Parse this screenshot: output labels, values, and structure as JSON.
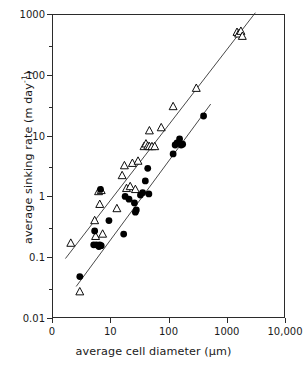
{
  "chart_data": {
    "type": "scatter",
    "title": "",
    "xlabel": "average cell diameter (µm)",
    "ylabel": "average sinking rate (m day⁻¹)",
    "xscale": "log",
    "yscale": "log",
    "xlim": [
      1,
      10000
    ],
    "ylim": [
      0.01,
      1000
    ],
    "grid": false,
    "legend": "none",
    "xticks": [
      1,
      10,
      100,
      1000,
      10000
    ],
    "xticklabels": [
      "0",
      "10",
      "100",
      "1000",
      "10,000"
    ],
    "yticks": [
      0.01,
      0.1,
      1,
      10,
      100,
      1000
    ],
    "yticklabels": [
      "0.01",
      "0.1",
      "1",
      "10",
      "100",
      "1000"
    ],
    "series": [
      {
        "name": "open triangles",
        "marker": "triangle-up-open",
        "color": "#000000",
        "points": [
          [
            2.1,
            0.17
          ],
          [
            3.0,
            0.027
          ],
          [
            5.4,
            0.4
          ],
          [
            5.6,
            0.22
          ],
          [
            6.3,
            1.2
          ],
          [
            6.6,
            0.74
          ],
          [
            7.0,
            1.25
          ],
          [
            7.4,
            0.24
          ],
          [
            13.0,
            0.63
          ],
          [
            16.0,
            2.2
          ],
          [
            17.5,
            3.2
          ],
          [
            19.0,
            1.35
          ],
          [
            22.0,
            1.45
          ],
          [
            24.0,
            3.5
          ],
          [
            27.0,
            1.3
          ],
          [
            30.0,
            3.8
          ],
          [
            38.0,
            6.6
          ],
          [
            41.0,
            7.3
          ],
          [
            44.0,
            6.7
          ],
          [
            47.0,
            6.6
          ],
          [
            52.0,
            6.6
          ],
          [
            58.0,
            6.6
          ],
          [
            47.0,
            12.0
          ],
          [
            75.0,
            13.5
          ],
          [
            120.0,
            30.0
          ],
          [
            300.0,
            60.0
          ],
          [
            1500.0,
            500.0
          ],
          [
            1600.0,
            470.0
          ],
          [
            1750.0,
            520.0
          ],
          [
            1850.0,
            430.0
          ]
        ]
      },
      {
        "name": "filled circles",
        "marker": "circle-filled",
        "color": "#000000",
        "points": [
          [
            3.0,
            0.048
          ],
          [
            5.2,
            0.16
          ],
          [
            5.4,
            0.27
          ],
          [
            5.8,
            0.16
          ],
          [
            6.4,
            0.15
          ],
          [
            6.6,
            0.16
          ],
          [
            6.8,
            1.3
          ],
          [
            7.0,
            0.155
          ],
          [
            9.5,
            0.4
          ],
          [
            17.0,
            0.24
          ],
          [
            18.0,
            1.0
          ],
          [
            21.0,
            0.9
          ],
          [
            26.0,
            0.78
          ],
          [
            27.0,
            0.55
          ],
          [
            28.0,
            0.6
          ],
          [
            33.0,
            1.05
          ],
          [
            36.0,
            1.15
          ],
          [
            40.0,
            1.8
          ],
          [
            44.0,
            2.9
          ],
          [
            46.0,
            1.1
          ],
          [
            120.0,
            5.0
          ],
          [
            130.0,
            7.0
          ],
          [
            140.0,
            7.6
          ],
          [
            155.0,
            8.8
          ],
          [
            165.0,
            7.0
          ],
          [
            175.0,
            7.2
          ],
          [
            400.0,
            21.0
          ]
        ]
      }
    ],
    "fitlines": [
      {
        "name": "triangle-fit",
        "x": [
          1.7,
          3100
        ],
        "y": [
          0.095,
          1050
        ]
      },
      {
        "name": "circle-fit",
        "x": [
          2.6,
          530
        ],
        "y": [
          0.033,
          33.0
        ]
      }
    ]
  }
}
